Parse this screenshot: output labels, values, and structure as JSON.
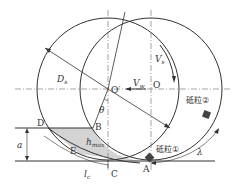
{
  "diagram": {
    "labels": {
      "Ds": "D",
      "Ds_sub": "s",
      "O_prime": "O′",
      "O": "O",
      "Vw": "V",
      "Vw_sub": "w",
      "Vs": "V",
      "Vs_sub": "s",
      "theta": "θ",
      "D": "D",
      "B": "B",
      "E": "E",
      "C": "C",
      "A": "A",
      "a": "a",
      "hmax": "h",
      "hmax_sub": "max",
      "lc": "l",
      "lc_sub": "c",
      "lambda": "λ",
      "grain1": "砥粒①",
      "grain2": "砥粒②"
    },
    "colors": {
      "line": "#333333",
      "shade": "#d4d4d4",
      "grain": "#444444"
    }
  }
}
